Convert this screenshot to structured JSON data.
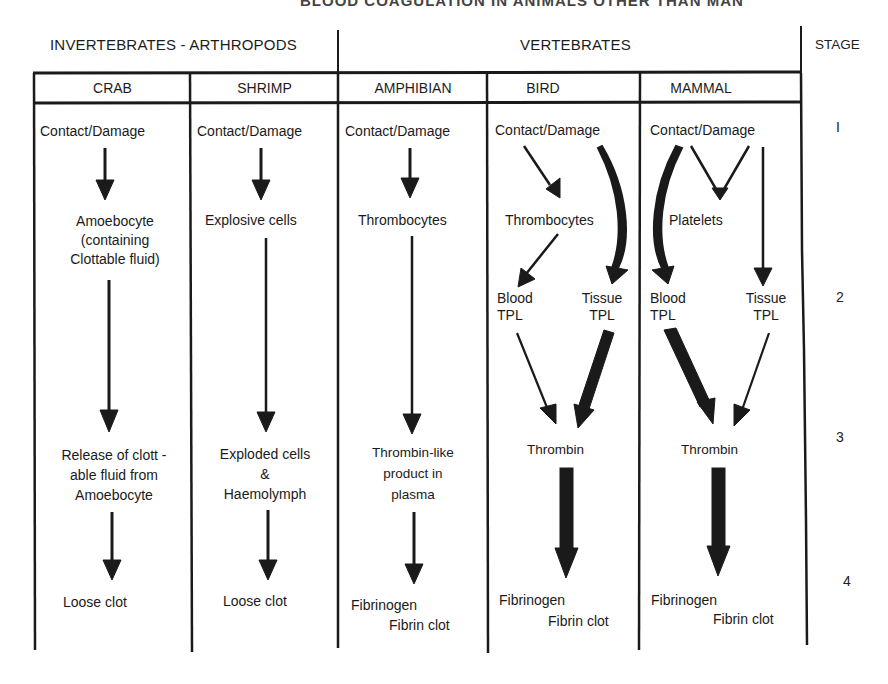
{
  "figure": {
    "title_partial": "BLOOD COAGULATION IN ANIMALS OTHER THAN MAN",
    "group_headers": {
      "invertebrates": "INVERTEBRATES - ARTHROPODS",
      "vertebrates": "VERTEBRATES",
      "stage": "STAGE"
    },
    "columns": [
      {
        "id": "crab",
        "label": "CRAB"
      },
      {
        "id": "shrimp",
        "label": "SHRIMP"
      },
      {
        "id": "amphibian",
        "label": "AMPHIBIAN"
      },
      {
        "id": "bird",
        "label": "BIRD"
      },
      {
        "id": "mammal",
        "label": "MAMMAL"
      }
    ],
    "stages": [
      "I",
      "2",
      "3",
      "4"
    ],
    "crab": {
      "stage1": "Contact/Damage",
      "cell_line1": "Amoebocyte",
      "cell_line2": "(containing",
      "cell_line3": "Clottable fluid)",
      "stage3_line1": "Release of clott -",
      "stage3_line2": "able fluid from",
      "stage3_line3": "Amoebocyte",
      "stage4": "Loose clot"
    },
    "shrimp": {
      "stage1": "Contact/Damage",
      "cell": "Explosive cells",
      "stage3_line1": "Exploded cells",
      "stage3_line2": "&",
      "stage3_line3": "Haemolymph",
      "stage4": "Loose clot"
    },
    "amphibian": {
      "stage1": "Contact/Damage",
      "cell": "Thrombocytes",
      "stage3_line1": "Thrombin-like",
      "stage3_line2": "product in",
      "stage3_line3": "plasma",
      "stage4_line1": "Fibrinogen",
      "stage4_line2": "Fibrin clot"
    },
    "bird": {
      "stage1": "Contact/Damage",
      "cell": "Thrombocytes",
      "blood_tpl_line1": "Blood",
      "blood_tpl_line2": "TPL",
      "tissue_tpl_line1": "Tissue",
      "tissue_tpl_line2": "TPL",
      "stage3": "Thrombin",
      "stage4_line1": "Fibrinogen",
      "stage4_line2": "Fibrin clot"
    },
    "mammal": {
      "stage1": "Contact/Damage",
      "cell": "Platelets",
      "blood_tpl_line1": "Blood",
      "blood_tpl_line2": "TPL",
      "tissue_tpl_line1": "Tissue",
      "tissue_tpl_line2": "TPL",
      "stage3": "Thrombin",
      "stage4_line1": "Fibrinogen",
      "stage4_line2": "Fibrin clot"
    },
    "colors": {
      "ink": "#1a1a1a",
      "paper": "#ffffff"
    }
  }
}
